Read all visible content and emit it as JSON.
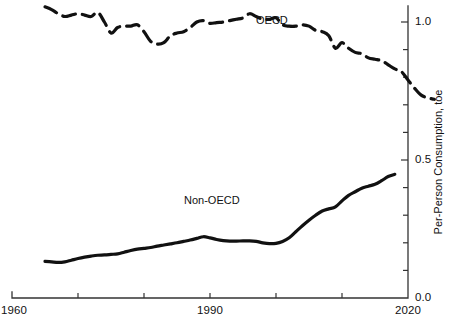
{
  "chart_data": {
    "type": "line",
    "title": "",
    "subtitle": "",
    "xlabel": "",
    "ylabel": "Per-Person Consumption, toe",
    "xlim": [
      1960,
      2020
    ],
    "ylim": [
      0.0,
      1.1
    ],
    "grid": false,
    "legend_position": "inline-annotations",
    "x_ticks": [
      1960,
      1970,
      1980,
      1990,
      2000,
      2010,
      2020
    ],
    "x_tick_labels": [
      "1960",
      "",
      "",
      "1990",
      "",
      "",
      "2020"
    ],
    "x_tick_labels_visible": [
      "1960",
      "1990",
      "2020"
    ],
    "y_ticks": [
      0.0,
      0.1,
      0.2,
      0.3,
      0.4,
      0.5,
      0.6,
      0.7,
      0.8,
      0.9,
      1.0
    ],
    "y_tick_labels": [
      "0.0",
      "",
      "",
      "",
      "",
      "0.5",
      "",
      "",
      "",
      "",
      "1.0"
    ],
    "y_tick_labels_visible": [
      "0.0",
      "0.5",
      "1.0"
    ],
    "y_axis_side": "right",
    "annotations": [
      {
        "text": "OECD",
        "x": 1997,
        "y": 1.02
      },
      {
        "text": "Non-OECD",
        "x": 1986,
        "y": 0.385
      }
    ],
    "series": [
      {
        "name": "OECD",
        "style": "dashed",
        "color": "#111111",
        "x": [
          1965,
          1966,
          1967,
          1968,
          1969,
          1970,
          1971,
          1972,
          1973,
          1974,
          1975,
          1976,
          1977,
          1978,
          1979,
          1980,
          1981,
          1982,
          1983,
          1984,
          1985,
          1986,
          1987,
          1988,
          1989,
          1990,
          1991,
          1992,
          1993,
          1994,
          1995,
          1996,
          1997,
          1998,
          1999,
          2000,
          2001,
          2002,
          2003,
          2004,
          2005,
          2006,
          2007,
          2008,
          2009,
          2010,
          2011,
          2012,
          2013,
          2014,
          2015,
          2016,
          2017,
          2018
        ],
        "values": [
          1.055,
          1.045,
          1.03,
          1.02,
          1.025,
          1.03,
          1.025,
          1.02,
          1.035,
          1.0,
          0.96,
          0.98,
          0.985,
          0.985,
          0.99,
          0.965,
          0.93,
          0.92,
          0.925,
          0.95,
          0.96,
          0.965,
          0.98,
          1.0,
          1.005,
          0.995,
          0.998,
          1.0,
          1.005,
          1.01,
          1.015,
          1.03,
          1.02,
          1.01,
          1.01,
          1.015,
          0.99,
          0.985,
          0.985,
          0.99,
          0.985,
          0.97,
          0.965,
          0.95,
          0.905,
          0.925,
          0.905,
          0.89,
          0.885,
          0.87,
          0.865,
          0.86,
          0.845,
          0.83
        ],
        "values_late": [
          0.82,
          0.79,
          0.76,
          0.735,
          0.725,
          0.72
        ]
      },
      {
        "name": "Non-OECD",
        "style": "solid",
        "color": "#111111",
        "x": [
          1965,
          1966,
          1967,
          1968,
          1969,
          1970,
          1971,
          1972,
          1973,
          1974,
          1975,
          1976,
          1977,
          1978,
          1979,
          1980,
          1981,
          1982,
          1983,
          1984,
          1985,
          1986,
          1987,
          1988,
          1989,
          1990,
          1991,
          1992,
          1993,
          1994,
          1995,
          1996,
          1997,
          1998,
          1999,
          2000,
          2001,
          2002,
          2003,
          2004,
          2005,
          2006,
          2007,
          2008,
          2009,
          2010,
          2011,
          2012,
          2013,
          2014,
          2015,
          2016,
          2017,
          2018
        ],
        "values": [
          0.133,
          0.131,
          0.129,
          0.131,
          0.137,
          0.143,
          0.148,
          0.152,
          0.155,
          0.156,
          0.158,
          0.16,
          0.166,
          0.172,
          0.177,
          0.18,
          0.183,
          0.188,
          0.192,
          0.196,
          0.2,
          0.205,
          0.21,
          0.216,
          0.222,
          0.218,
          0.212,
          0.208,
          0.206,
          0.206,
          0.207,
          0.207,
          0.205,
          0.2,
          0.197,
          0.198,
          0.205,
          0.218,
          0.24,
          0.262,
          0.282,
          0.3,
          0.315,
          0.323,
          0.33,
          0.352,
          0.372,
          0.385,
          0.398,
          0.405,
          0.412,
          0.425,
          0.44,
          0.448
        ]
      }
    ]
  },
  "axis": {
    "y_title": "Per-Person Consumption, toe",
    "x_labels": [
      {
        "text": "1960",
        "value": 1960
      },
      {
        "text": "1990",
        "value": 1990
      },
      {
        "text": "2020",
        "value": 2020
      }
    ],
    "y_labels": [
      {
        "text": "1.0",
        "value": 1.0
      },
      {
        "text": "0.5",
        "value": 0.5
      },
      {
        "text": "0.0",
        "value": 0.0
      }
    ]
  },
  "labels": {
    "oecd": "OECD",
    "non_oecd": "Non-OECD"
  },
  "colors": {
    "line": "#111111",
    "axis": "#333333",
    "background": "#ffffff",
    "text": "#111111"
  }
}
